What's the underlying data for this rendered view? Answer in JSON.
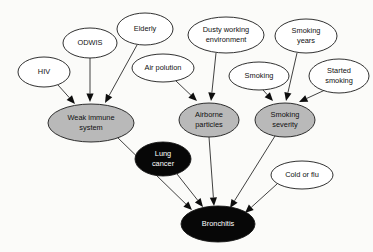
{
  "diagram": {
    "colors": {
      "white_node_fill": "#ffffff",
      "gray_node_fill": "#b9b9b9",
      "black_node_fill": "#070707",
      "outline": "#1a1a1a",
      "edge": "#2b2b2b",
      "background": "#fbfbf9",
      "dark_text": "#101010",
      "light_text": "#ffffff"
    },
    "nodes": [
      {
        "id": "hiv",
        "label_line1": "HIV",
        "label_line2": "",
        "style": "white",
        "cx": 44,
        "cy": 72,
        "rx": 26,
        "ry": 15
      },
      {
        "id": "odwis",
        "label_line1": "ODWIS",
        "label_line2": "",
        "style": "white",
        "cx": 90,
        "cy": 43,
        "rx": 27,
        "ry": 15
      },
      {
        "id": "elderly",
        "label_line1": "Elderly",
        "label_line2": "",
        "style": "white",
        "cx": 145,
        "cy": 29,
        "rx": 28,
        "ry": 16
      },
      {
        "id": "airpol",
        "label_line1": "Air polution",
        "label_line2": "",
        "style": "white",
        "cx": 163,
        "cy": 68,
        "rx": 31,
        "ry": 14
      },
      {
        "id": "dusty",
        "label_line1": "Dusty working",
        "label_line2": "environment",
        "style": "white",
        "cx": 226,
        "cy": 35,
        "rx": 38,
        "ry": 18
      },
      {
        "id": "smoking",
        "label_line1": "Smoking",
        "label_line2": "",
        "style": "white",
        "cx": 259,
        "cy": 76,
        "rx": 30,
        "ry": 14
      },
      {
        "id": "smkyears",
        "label_line1": "Smoking",
        "label_line2": "years",
        "style": "white",
        "cx": 306,
        "cy": 36,
        "rx": 31,
        "ry": 17
      },
      {
        "id": "started",
        "label_line1": "Started",
        "label_line2": "smoking",
        "style": "white",
        "cx": 339,
        "cy": 76,
        "rx": 30,
        "ry": 17
      },
      {
        "id": "weakimm",
        "label_line1": "Weak immune",
        "label_line2": "system",
        "style": "gray",
        "cx": 91,
        "cy": 123,
        "rx": 43,
        "ry": 19
      },
      {
        "id": "airborne",
        "label_line1": "Airborne",
        "label_line2": "particles",
        "style": "gray",
        "cx": 209,
        "cy": 120,
        "rx": 30,
        "ry": 17
      },
      {
        "id": "smksev",
        "label_line1": "Smoking",
        "label_line2": "severity",
        "style": "gray",
        "cx": 285,
        "cy": 120,
        "rx": 30,
        "ry": 17
      },
      {
        "id": "lung",
        "label_line1": "Lung",
        "label_line2": "cancer",
        "style": "black",
        "cx": 163,
        "cy": 159,
        "rx": 28,
        "ry": 17
      },
      {
        "id": "coldflu",
        "label_line1": "Cold or flu",
        "label_line2": "",
        "style": "white",
        "cx": 302,
        "cy": 175,
        "rx": 31,
        "ry": 14
      },
      {
        "id": "bronch",
        "label_line1": "Bronchitis",
        "label_line2": "",
        "style": "black",
        "cx": 218,
        "cy": 224,
        "rx": 37,
        "ry": 18
      }
    ],
    "edges": [
      {
        "from": "hiv",
        "to": "weakimm",
        "x1": 58,
        "y1": 85,
        "x2": 75,
        "y2": 104
      },
      {
        "from": "odwis",
        "to": "weakimm",
        "x1": 90,
        "y1": 58,
        "x2": 90,
        "y2": 102
      },
      {
        "from": "elderly",
        "to": "weakimm",
        "x1": 137,
        "y1": 45,
        "x2": 105,
        "y2": 103
      },
      {
        "from": "airpol",
        "to": "airborne",
        "x1": 176,
        "y1": 81,
        "x2": 197,
        "y2": 101
      },
      {
        "from": "dusty",
        "to": "airborne",
        "x1": 216,
        "y1": 53,
        "x2": 211,
        "y2": 101
      },
      {
        "from": "smoking",
        "to": "smksev",
        "x1": 263,
        "y1": 90,
        "x2": 273,
        "y2": 101
      },
      {
        "from": "smkyears",
        "to": "smksev",
        "x1": 297,
        "y1": 53,
        "x2": 286,
        "y2": 101
      },
      {
        "from": "started",
        "to": "smksev",
        "x1": 325,
        "y1": 90,
        "x2": 299,
        "y2": 102
      },
      {
        "from": "weakimm",
        "to": "bronch",
        "x1": 117,
        "y1": 137,
        "x2": 192,
        "y2": 210
      },
      {
        "from": "lung",
        "to": "bronch",
        "x1": 177,
        "y1": 174,
        "x2": 203,
        "y2": 207
      },
      {
        "from": "airborne",
        "to": "bronch",
        "x1": 209,
        "y1": 137,
        "x2": 214,
        "y2": 206
      },
      {
        "from": "smksev",
        "to": "bronch",
        "x1": 275,
        "y1": 136,
        "x2": 230,
        "y2": 208
      },
      {
        "from": "coldflu",
        "to": "bronch",
        "x1": 277,
        "y1": 184,
        "x2": 245,
        "y2": 213
      }
    ]
  }
}
